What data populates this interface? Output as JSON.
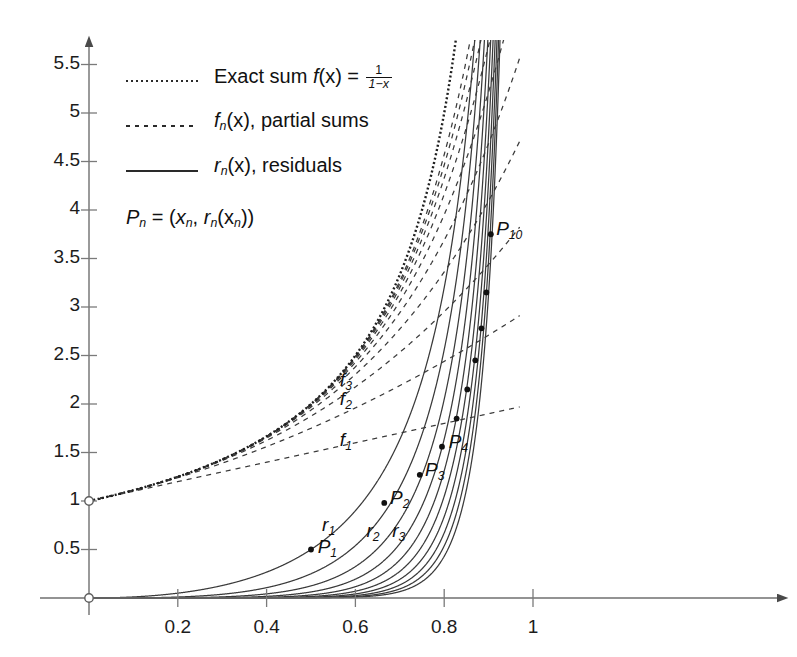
{
  "figure": {
    "background_color": "#ffffff",
    "ink_color": "#1a1a1a",
    "axis_color": "#6b6b6b"
  },
  "legend": {
    "entries": [
      {
        "id": "exact-sum",
        "style": "fine-dotted",
        "text_prefix": "Exact sum ",
        "fn_name": "f",
        "fn_arg": "(x) = ",
        "frac_num": "1",
        "frac_den": "1−x"
      },
      {
        "id": "partial-sums",
        "style": "dashed",
        "fn_name": "f",
        "fn_sub": "n",
        "fn_rest": "(x), partial sums"
      },
      {
        "id": "residuals",
        "style": "solid",
        "fn_name": "r",
        "fn_sub": "n",
        "fn_rest": "(x), residuals"
      }
    ],
    "point_definition": {
      "p": "P",
      "p_sub": "n",
      "equals": " = (",
      "x": "x",
      "x_sub": "n",
      "comma": ", ",
      "r": "r",
      "r_sub": "n",
      "r_arg": "(x",
      "r_arg_sub": "n",
      "close": "))"
    }
  },
  "chart_data": {
    "type": "line",
    "title": "",
    "xlabel": "",
    "ylabel": "",
    "xlim": [
      -0.06,
      1.12
    ],
    "ylim": [
      -0.18,
      5.62
    ],
    "grid": false,
    "legend_position": "upper-left-inside",
    "x_ticks": [
      0.2,
      0.4,
      0.6,
      0.8,
      1
    ],
    "x_tick_labels": [
      "0.2",
      "0.4",
      "0.6",
      "0.8",
      "1"
    ],
    "y_ticks": [
      0.5,
      1,
      1.5,
      2,
      2.5,
      3,
      3.5,
      4,
      4.5,
      5,
      5.5
    ],
    "y_tick_labels": [
      "0.5",
      "1",
      "1.5",
      "2",
      "2.5",
      "3",
      "3.5",
      "4",
      "4.5",
      "5",
      "5.5"
    ],
    "axes_have_arrows": true,
    "origin_marker": "open-circle",
    "extra_markers": [
      {
        "x": 0,
        "y": 0,
        "style": "open-circle"
      },
      {
        "x": 0,
        "y": 1,
        "style": "open-circle"
      }
    ],
    "series": [
      {
        "name": "Exact sum f(x) = 1/(1-x)",
        "formula": "1/(1-x)",
        "style": "fine-dotted",
        "n": null
      },
      {
        "name": "f_n(x), partial sums",
        "formula": "(1-x^(n+1))/(1-x)",
        "style": "dashed",
        "n_values": [
          1,
          2,
          3,
          4,
          5,
          6,
          7,
          8,
          9,
          10
        ]
      },
      {
        "name": "r_n(x), residuals",
        "formula": "x^(n+1)/(1-x)",
        "style": "solid",
        "n_values": [
          1,
          2,
          3,
          4,
          5,
          6,
          7,
          8,
          9,
          10
        ]
      }
    ],
    "marked_points": [
      {
        "label": "P1",
        "n": 1,
        "x": 0.5,
        "y": 0.5
      },
      {
        "label": "P2",
        "n": 2,
        "x": 0.665,
        "y": 0.98
      },
      {
        "label": "P3",
        "n": 3,
        "x": 0.745,
        "y": 1.27
      },
      {
        "label": "P4",
        "n": 4,
        "x": 0.795,
        "y": 1.56
      },
      {
        "label": "P5",
        "n": 5,
        "x": 0.828,
        "y": 1.85
      },
      {
        "label": "P6",
        "n": 6,
        "x": 0.852,
        "y": 2.15
      },
      {
        "label": "P7",
        "n": 7,
        "x": 0.87,
        "y": 2.45
      },
      {
        "label": "P8",
        "n": 8,
        "x": 0.884,
        "y": 2.78
      },
      {
        "label": "P9",
        "n": 9,
        "x": 0.895,
        "y": 3.15
      },
      {
        "label": "P10",
        "n": 10,
        "x": 0.905,
        "y": 3.75
      }
    ],
    "annotations": [
      {
        "id": "f1-label",
        "text": "f",
        "sub": "1",
        "x": 0.565,
        "y": 1.6
      },
      {
        "id": "f2-label",
        "text": "f",
        "sub": "2",
        "x": 0.565,
        "y": 2.02
      },
      {
        "id": "f3-label",
        "text": "f",
        "sub": "3",
        "x": 0.565,
        "y": 2.22
      },
      {
        "id": "r1-label",
        "text": "r",
        "sub": "1",
        "x": 0.525,
        "y": 0.72
      },
      {
        "id": "r2-label",
        "text": "r",
        "sub": "2",
        "x": 0.625,
        "y": 0.66
      },
      {
        "id": "r3-label",
        "text": "r",
        "sub": "3",
        "x": 0.683,
        "y": 0.66
      },
      {
        "id": "p1-label",
        "text": "P",
        "sub": "1",
        "x": 0.515,
        "y": 0.49
      },
      {
        "id": "p2-label",
        "text": "P",
        "sub": "2",
        "x": 0.678,
        "y": 1.0
      },
      {
        "id": "p3-label",
        "text": "P",
        "sub": "3",
        "x": 0.757,
        "y": 1.29
      },
      {
        "id": "p4-label",
        "text": "P",
        "sub": "4",
        "x": 0.81,
        "y": 1.58
      },
      {
        "id": "p10-label",
        "text": "P",
        "sub": "10",
        "x": 0.917,
        "y": 3.77
      }
    ]
  }
}
